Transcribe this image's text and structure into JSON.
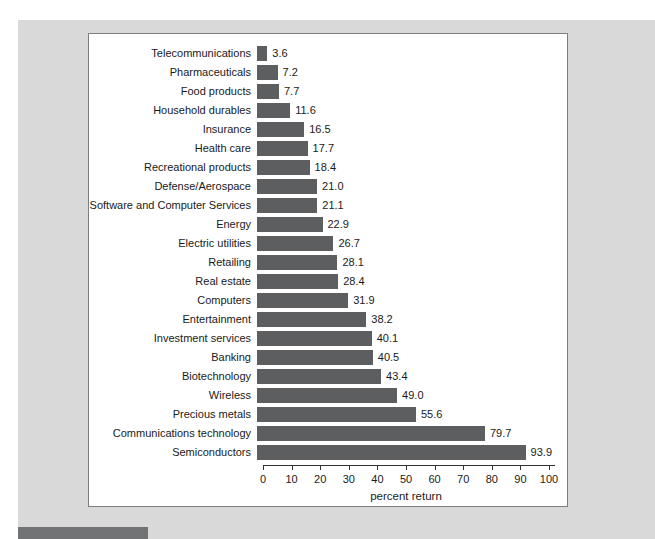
{
  "colors": {
    "page_bg": "#ffffff",
    "gray_panel_bg": "#d9d9d9",
    "chart_bg": "#ffffff",
    "chart_border": "#7d7d7d",
    "bar": "#5c5e60",
    "accent_bar": "#717374",
    "axis": "#333333"
  },
  "chart_data": {
    "type": "bar",
    "orientation": "horizontal",
    "categories": [
      "Telecommunications",
      "Pharmaceuticals",
      "Food products",
      "Household durables",
      "Insurance",
      "Health care",
      "Recreational products",
      "Defense/Aerospace",
      "Software and Computer Services",
      "Energy",
      "Electric utilities",
      "Retailing",
      "Real estate",
      "Computers",
      "Entertainment",
      "Investment services",
      "Banking",
      "Biotechnology",
      "Wireless",
      "Precious metals",
      "Communications technology",
      "Semiconductors"
    ],
    "values": [
      3.6,
      7.2,
      7.7,
      11.6,
      16.5,
      17.7,
      18.4,
      21.0,
      21.1,
      22.9,
      26.7,
      28.1,
      28.4,
      31.9,
      38.2,
      40.1,
      40.5,
      43.4,
      49.0,
      55.6,
      79.7,
      93.9
    ],
    "value_labels": [
      "3.6",
      "7.2",
      "7.7",
      "11.6",
      "16.5",
      "17.7",
      "18.4",
      "21.0",
      "21.1",
      "22.9",
      "26.7",
      "28.1",
      "28.4",
      "31.9",
      "38.2",
      "40.1",
      "40.5",
      "43.4",
      "49.0",
      "55.6",
      "79.7",
      "93.9"
    ],
    "xlabel": "percent return",
    "xlim": [
      0,
      100
    ],
    "xticks": [
      0,
      10,
      20,
      30,
      40,
      50,
      60,
      70,
      80,
      90,
      100
    ],
    "xtick_labels": [
      "0",
      "10",
      "20",
      "30",
      "40",
      "50",
      "60",
      "70",
      "80",
      "90",
      "100"
    ],
    "grid": "off",
    "legend": "none",
    "title": ""
  }
}
